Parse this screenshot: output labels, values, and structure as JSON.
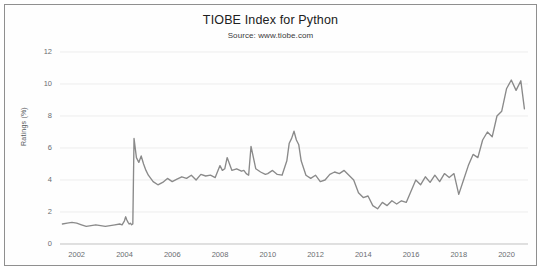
{
  "chart_data": {
    "type": "line",
    "title": "TIOBE Index for Python",
    "subtitle": "Source: www.tiobe.com",
    "xlabel": "",
    "ylabel": "Ratings (%)",
    "xlim": [
      2001.3,
      2020.9
    ],
    "ylim": [
      0,
      12
    ],
    "grid": true,
    "legend": null,
    "line_color": "#8a8a8a",
    "xticks": [
      2002,
      2004,
      2006,
      2008,
      2010,
      2012,
      2014,
      2016,
      2018,
      2020
    ],
    "yticks": [
      0,
      2,
      4,
      6,
      8,
      10,
      12
    ],
    "series": [
      {
        "name": "Python",
        "x": [
          2001.4,
          2001.6,
          2001.8,
          2002.0,
          2002.2,
          2002.4,
          2002.6,
          2002.8,
          2003.0,
          2003.2,
          2003.4,
          2003.6,
          2003.8,
          2003.9,
          2004.0,
          2004.05,
          2004.1,
          2004.15,
          2004.2,
          2004.25,
          2004.3,
          2004.35,
          2004.4,
          2004.5,
          2004.6,
          2004.7,
          2004.8,
          2004.9,
          2005.0,
          2005.2,
          2005.4,
          2005.6,
          2005.8,
          2006.0,
          2006.2,
          2006.4,
          2006.6,
          2006.8,
          2007.0,
          2007.2,
          2007.4,
          2007.6,
          2007.8,
          2008.0,
          2008.1,
          2008.2,
          2008.3,
          2008.5,
          2008.7,
          2008.9,
          2009.0,
          2009.1,
          2009.2,
          2009.3,
          2009.5,
          2009.7,
          2009.9,
          2010.0,
          2010.2,
          2010.4,
          2010.6,
          2010.8,
          2010.9,
          2011.0,
          2011.1,
          2011.2,
          2011.3,
          2011.4,
          2011.6,
          2011.8,
          2012.0,
          2012.2,
          2012.4,
          2012.6,
          2012.8,
          2013.0,
          2013.2,
          2013.4,
          2013.6,
          2013.8,
          2014.0,
          2014.2,
          2014.4,
          2014.6,
          2014.8,
          2015.0,
          2015.2,
          2015.4,
          2015.6,
          2015.8,
          2016.0,
          2016.2,
          2016.4,
          2016.6,
          2016.8,
          2017.0,
          2017.2,
          2017.4,
          2017.6,
          2017.8,
          2018.0,
          2018.2,
          2018.4,
          2018.6,
          2018.8,
          2019.0,
          2019.2,
          2019.4,
          2019.6,
          2019.8,
          2020.0,
          2020.2,
          2020.4,
          2020.6,
          2020.75
        ],
        "y": [
          1.25,
          1.3,
          1.35,
          1.3,
          1.2,
          1.1,
          1.15,
          1.2,
          1.15,
          1.1,
          1.15,
          1.2,
          1.25,
          1.2,
          1.45,
          1.7,
          1.5,
          1.35,
          1.25,
          1.3,
          1.2,
          1.25,
          6.6,
          5.4,
          5.1,
          5.5,
          5.0,
          4.6,
          4.3,
          3.9,
          3.7,
          3.85,
          4.1,
          3.9,
          4.05,
          4.2,
          4.1,
          4.3,
          4.0,
          4.35,
          4.25,
          4.3,
          4.15,
          4.9,
          4.6,
          4.7,
          5.4,
          4.6,
          4.7,
          4.55,
          4.6,
          4.4,
          4.3,
          6.1,
          4.7,
          4.5,
          4.35,
          4.4,
          4.6,
          4.35,
          4.3,
          5.2,
          6.3,
          6.6,
          7.05,
          6.5,
          6.2,
          5.2,
          4.3,
          4.1,
          4.3,
          3.9,
          4.0,
          4.35,
          4.5,
          4.4,
          4.6,
          4.3,
          4.0,
          3.2,
          2.9,
          3.0,
          2.4,
          2.2,
          2.6,
          2.4,
          2.7,
          2.5,
          2.7,
          2.6,
          3.3,
          4.0,
          3.7,
          4.2,
          3.85,
          4.3,
          3.9,
          4.4,
          4.15,
          4.4,
          3.1,
          4.0,
          4.9,
          5.6,
          5.4,
          6.5,
          7.0,
          6.7,
          8.0,
          8.3,
          9.7,
          10.25,
          9.6,
          10.2,
          8.45
        ]
      }
    ]
  }
}
